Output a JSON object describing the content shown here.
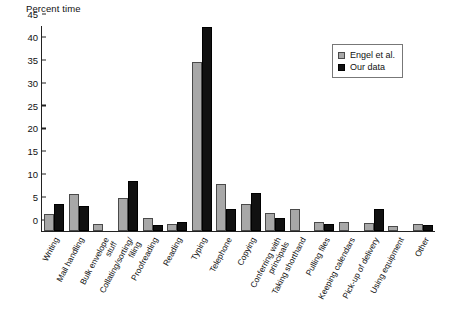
{
  "chart_data": {
    "type": "bar",
    "title": "",
    "xlabel": "",
    "ylabel": "Percent time",
    "ylim": [
      0,
      45
    ],
    "yticks": [
      0,
      5,
      10,
      15,
      20,
      25,
      30,
      35,
      40,
      45
    ],
    "grid": false,
    "legend_position": "top-right",
    "categories": [
      "Writing",
      "Mail handling",
      "Bulk envelope\nstuff",
      "Collating/sorting/\nfiling",
      "Proofreading",
      "Reading",
      "Typing",
      "Telephone",
      "Copying",
      "Conferring with\nprincipals",
      "Taking shorthand",
      "Pulling files",
      "Keeping calendars",
      "Pick-up of delivery",
      "Using equipment",
      "Other"
    ],
    "series": [
      {
        "name": "Engel et al.",
        "color": "#a8a8a8",
        "values": [
          3.7,
          8.0,
          1.5,
          7.2,
          2.8,
          1.5,
          37.0,
          10.3,
          5.9,
          3.9,
          4.8,
          2.0,
          2.0,
          1.8,
          1.0,
          1.5
        ]
      },
      {
        "name": "Our data",
        "color": "#111111",
        "values": [
          6.0,
          5.5,
          0,
          11.0,
          1.3,
          2.0,
          44.5,
          4.8,
          8.3,
          2.8,
          0,
          1.5,
          0,
          4.8,
          0,
          1.3
        ]
      }
    ]
  },
  "legend": {
    "items": [
      {
        "label": "Engel et al."
      },
      {
        "label": "Our data"
      }
    ]
  }
}
